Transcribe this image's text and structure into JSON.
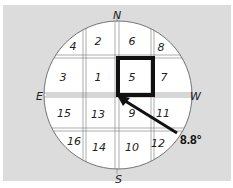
{
  "diagram": {
    "compass": {
      "north": "N",
      "south": "S",
      "east": "E",
      "west": "W"
    },
    "cells": [
      {
        "label": "4",
        "x": 73,
        "y": 50
      },
      {
        "label": "2",
        "x": 98,
        "y": 45
      },
      {
        "label": "6",
        "x": 132,
        "y": 45
      },
      {
        "label": "8",
        "x": 161,
        "y": 51
      },
      {
        "label": "3",
        "x": 63,
        "y": 81
      },
      {
        "label": "1",
        "x": 98,
        "y": 81
      },
      {
        "label": "5",
        "x": 132,
        "y": 81
      },
      {
        "label": "7",
        "x": 164,
        "y": 81
      },
      {
        "label": "15",
        "x": 64,
        "y": 117
      },
      {
        "label": "13",
        "x": 98,
        "y": 118
      },
      {
        "label": "9",
        "x": 132,
        "y": 117
      },
      {
        "label": "11",
        "x": 163,
        "y": 117
      },
      {
        "label": "16",
        "x": 74,
        "y": 145
      },
      {
        "label": "14",
        "x": 99,
        "y": 151
      },
      {
        "label": "10",
        "x": 132,
        "y": 151
      },
      {
        "label": "12",
        "x": 158,
        "y": 147
      }
    ],
    "highlighted_cell": "5",
    "arrow_label": "8.8°",
    "colors": {
      "background": "#dcdcdc",
      "circle": "#ffffff",
      "ink": "#111111"
    }
  }
}
